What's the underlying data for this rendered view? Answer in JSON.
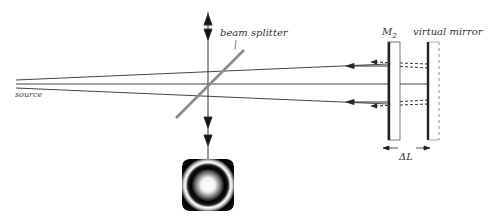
{
  "diagram": {
    "labels": {
      "source": "source",
      "beam_splitter": "beam splitter",
      "mirror": "M",
      "mirror_subscript": "2",
      "virtual_mirror": "virtual mirror",
      "delta_l": "ΔL"
    },
    "colors": {
      "beam": "#444444",
      "splitter": "#8a8a8a",
      "mirror": "#222222",
      "background": "#ffffff"
    },
    "elements": [
      {
        "name": "source",
        "type": "light-source"
      },
      {
        "name": "beam-splitter",
        "type": "optic"
      },
      {
        "name": "mirror-M2",
        "type": "mirror"
      },
      {
        "name": "virtual-mirror",
        "type": "mirror"
      },
      {
        "name": "interference-pattern",
        "type": "fringe-image"
      }
    ]
  }
}
